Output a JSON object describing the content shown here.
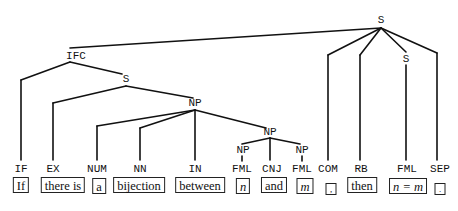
{
  "diagram": {
    "type": "parse-tree",
    "nodes": {
      "root_s": "S",
      "ifc": "IFC",
      "s_inner": "S",
      "np_main": "NP",
      "np_coord": "NP",
      "np_n": "NP",
      "np_m": "NP",
      "s_right": "S"
    },
    "leaves": [
      {
        "tag": "IF",
        "word": "If"
      },
      {
        "tag": "EX",
        "word": "there is"
      },
      {
        "tag": "NUM",
        "word": "a"
      },
      {
        "tag": "NN",
        "word": "bijection"
      },
      {
        "tag": "IN",
        "word": "between"
      },
      {
        "tag": "FML",
        "word": "n"
      },
      {
        "tag": "CNJ",
        "word": "and"
      },
      {
        "tag": "FML",
        "word": "m"
      },
      {
        "tag": "COM",
        "word": ","
      },
      {
        "tag": "RB",
        "word": "then"
      },
      {
        "tag": "FML",
        "word": "n = m"
      },
      {
        "tag": "SEP",
        "word": "."
      }
    ]
  }
}
